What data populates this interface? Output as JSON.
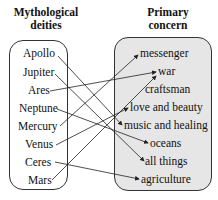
{
  "diagram": {
    "left_header": [
      "Mythological",
      "deities"
    ],
    "right_header": [
      "Primary",
      "concern"
    ],
    "domain": [
      "Apollo",
      "Jupiter",
      "Ares",
      "Neptune",
      "Mercury",
      "Venus",
      "Ceres",
      "Mars"
    ],
    "codomain": [
      "messenger",
      "war",
      "craftsman",
      "love and beauty",
      "music and healing",
      "oceans",
      "all things",
      "agriculture"
    ],
    "mappings": [
      {
        "from": "Apollo",
        "to": "music and healing"
      },
      {
        "from": "Jupiter",
        "to": "all things"
      },
      {
        "from": "Ares",
        "to": "war"
      },
      {
        "from": "Neptune",
        "to": "oceans"
      },
      {
        "from": "Mercury",
        "to": "messenger"
      },
      {
        "from": "Venus",
        "to": "love and beauty"
      },
      {
        "from": "Ceres",
        "to": "agriculture"
      },
      {
        "from": "Mars",
        "to": "war"
      }
    ],
    "colors": {
      "left_box_fill": "#ffffff",
      "right_box_fill": "#e6e6e6",
      "stroke": "#222222"
    }
  }
}
